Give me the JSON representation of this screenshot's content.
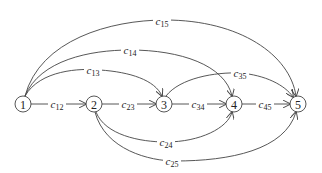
{
  "diagram": {
    "type": "directed-network",
    "nodes": [
      {
        "id": "1",
        "label": "1",
        "x": 23,
        "y": 104
      },
      {
        "id": "2",
        "label": "2",
        "x": 94,
        "y": 104
      },
      {
        "id": "3",
        "label": "3",
        "x": 164,
        "y": 104
      },
      {
        "id": "4",
        "label": "4",
        "x": 234,
        "y": 104
      },
      {
        "id": "5",
        "label": "5",
        "x": 298,
        "y": 104
      }
    ],
    "edges": [
      {
        "from": "1",
        "to": "2",
        "label_main": "c",
        "label_sub": "12",
        "lx": 57,
        "ly": 104
      },
      {
        "from": "2",
        "to": "3",
        "label_main": "c",
        "label_sub": "23",
        "lx": 128,
        "ly": 104
      },
      {
        "from": "3",
        "to": "4",
        "label_main": "c",
        "label_sub": "34",
        "lx": 198,
        "ly": 104
      },
      {
        "from": "4",
        "to": "5",
        "label_main": "c",
        "label_sub": "45",
        "lx": 265,
        "ly": 104
      },
      {
        "from": "1",
        "to": "3",
        "label_main": "c",
        "label_sub": "13",
        "lx": 93,
        "ly": 70
      },
      {
        "from": "1",
        "to": "4",
        "label_main": "c",
        "label_sub": "14",
        "lx": 130,
        "ly": 50
      },
      {
        "from": "1",
        "to": "5",
        "label_main": "c",
        "label_sub": "15",
        "lx": 162,
        "ly": 21
      },
      {
        "from": "3",
        "to": "5",
        "label_main": "c",
        "label_sub": "35",
        "lx": 240,
        "ly": 73
      },
      {
        "from": "2",
        "to": "4",
        "label_main": "c",
        "label_sub": "24",
        "lx": 166,
        "ly": 142
      },
      {
        "from": "2",
        "to": "5",
        "label_main": "c",
        "label_sub": "25",
        "lx": 172,
        "ly": 161
      }
    ]
  }
}
